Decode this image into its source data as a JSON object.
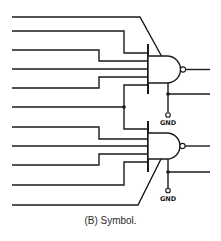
{
  "figure": {
    "caption": "(B) Symbol.",
    "type": "logic-gate-symbol",
    "gates": [
      {
        "id": "gate-1",
        "kind": "NAND",
        "inputs": 6,
        "ground_label": "GND"
      },
      {
        "id": "gate-2",
        "kind": "NAND",
        "inputs": 6,
        "ground_label": "GND"
      }
    ]
  },
  "labels": {
    "gnd_top": "GND",
    "gnd_bottom": "GND"
  },
  "colors": {
    "line": "#1a1a1a",
    "background": "#ffffff"
  }
}
